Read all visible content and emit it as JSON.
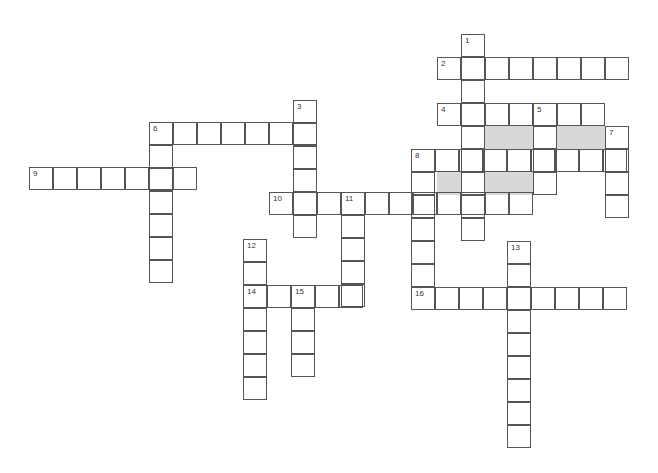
{
  "puzzle": {
    "cell_w": 24,
    "cell_h": 23,
    "words": [
      {
        "n": "1",
        "dir": "down",
        "x": 462,
        "y": 35,
        "len": 9
      },
      {
        "n": "2",
        "dir": "across",
        "x": 438,
        "y": 58,
        "len": 8
      },
      {
        "n": "3",
        "dir": "down",
        "x": 294,
        "y": 101,
        "len": 6
      },
      {
        "n": "4",
        "dir": "across",
        "x": 438,
        "y": 104,
        "len": 7
      },
      {
        "n": "5",
        "dir": "down",
        "x": 534,
        "y": 104,
        "len": 4
      },
      {
        "n": "6",
        "dir": "across",
        "x": 150,
        "y": 123,
        "len": 7
      },
      {
        "n": "",
        "dir": "down",
        "x": 150,
        "y": 123,
        "len": 7
      },
      {
        "n": "7",
        "dir": "down",
        "x": 606,
        "y": 127,
        "len": 4
      },
      {
        "n": "8",
        "dir": "across",
        "x": 412,
        "y": 150,
        "len": 9
      },
      {
        "n": "",
        "dir": "down",
        "x": 412,
        "y": 150,
        "len": 7
      },
      {
        "n": "9",
        "dir": "across",
        "x": 30,
        "y": 168,
        "len": 7
      },
      {
        "n": "10",
        "dir": "across",
        "x": 270,
        "y": 193,
        "len": 11
      },
      {
        "n": "11",
        "dir": "down",
        "x": 342,
        "y": 193,
        "len": 5
      },
      {
        "n": "12",
        "dir": "down",
        "x": 244,
        "y": 240,
        "len": 7
      },
      {
        "n": "13",
        "dir": "down",
        "x": 508,
        "y": 242,
        "len": 9
      },
      {
        "n": "14",
        "dir": "across",
        "x": 244,
        "y": 286,
        "len": 5
      },
      {
        "n": "15",
        "dir": "down",
        "x": 292,
        "y": 286,
        "len": 4
      },
      {
        "n": "16",
        "dir": "across",
        "x": 412,
        "y": 288,
        "len": 9
      }
    ],
    "shaded": [
      [
        486,
        127,
        48,
        23
      ],
      [
        558,
        127,
        48,
        23
      ],
      [
        438,
        173,
        24,
        23
      ],
      [
        486,
        173,
        48,
        23
      ]
    ]
  }
}
